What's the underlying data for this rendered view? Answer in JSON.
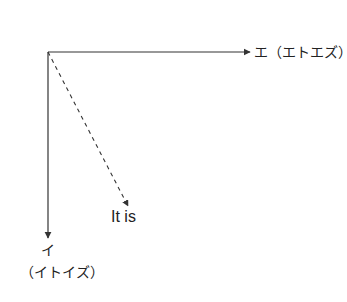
{
  "diagram": {
    "x_axis": {
      "label": "エ（エトエズ）"
    },
    "y_axis": {
      "label": "イ",
      "reading": "（イトイズ）"
    },
    "diagonal": {
      "label": "It is",
      "style": "dashed"
    },
    "colors": {
      "line": "#333333",
      "text": "#222222"
    }
  }
}
